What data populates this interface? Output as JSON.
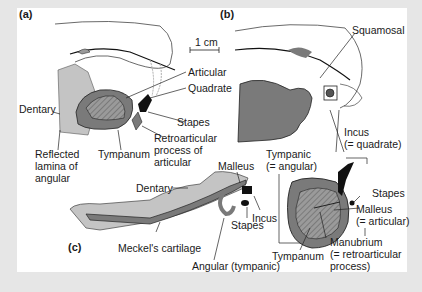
{
  "panels": {
    "a": {
      "label": "(a)"
    },
    "b": {
      "label": "(b)"
    },
    "c": {
      "label": "(c)"
    }
  },
  "scale_bar": "1 cm",
  "labels_a": {
    "articular": "Articular",
    "quadrate": "Quadrate",
    "dentary": "Dentary",
    "stapes": "Stapes",
    "reflected_1": "Reflected",
    "reflected_2": "lamina of",
    "reflected_3": "angular",
    "tympanum": "Tympanum",
    "retro_1": "Retroarticular",
    "retro_2": "process of",
    "retro_3": "articular"
  },
  "labels_b": {
    "squamosal": "Squamosal",
    "incus_1": "Incus",
    "incus_2": "(= quadrate)",
    "tympanic_1": "Tympanic",
    "tympanic_2": "(= angular)",
    "stapes": "Stapes",
    "malleus_1": "Malleus",
    "malleus_2": "(= articular)",
    "tympanum": "Tympanum",
    "manubrium_1": "Manubrium",
    "manubrium_2": "(= retroarticular",
    "manubrium_3": "process)"
  },
  "labels_c": {
    "malleus": "Malleus",
    "dentary": "Dentary",
    "incus": "Incus",
    "stapes": "Stapes",
    "meckel": "Meckel's cartilage",
    "angular": "Angular (tympanic)"
  },
  "colors": {
    "bg": "#e6e6e6",
    "panel": "#ffffff",
    "dark_gray": "#7a7a7a",
    "mid_gray": "#9a9a9a",
    "light_gray": "#c4c4c4",
    "black": "#111111"
  }
}
